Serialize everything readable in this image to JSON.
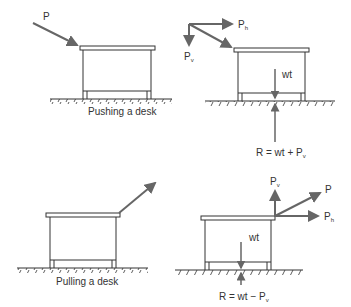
{
  "diagrams": [
    {
      "id": "push-desk",
      "caption": "Pushing a desk",
      "force_label": "P"
    },
    {
      "id": "push-desk-components",
      "labels": {
        "horizontal": "P",
        "horizontal_sub": "h",
        "vertical": "P",
        "vertical_sub": "v",
        "weight": "wt",
        "reaction": "R = wt + P",
        "reaction_sub": "v"
      }
    },
    {
      "id": "pull-desk",
      "caption": "Pulling a desk"
    },
    {
      "id": "pull-desk-components",
      "labels": {
        "force": "P",
        "horizontal": "P",
        "horizontal_sub": "h",
        "vertical": "P",
        "vertical_sub": "v",
        "weight": "wt",
        "reaction": "R = wt − P",
        "reaction_sub": "v"
      }
    }
  ],
  "colors": {
    "line": "#333333",
    "arrow": "#666666"
  }
}
